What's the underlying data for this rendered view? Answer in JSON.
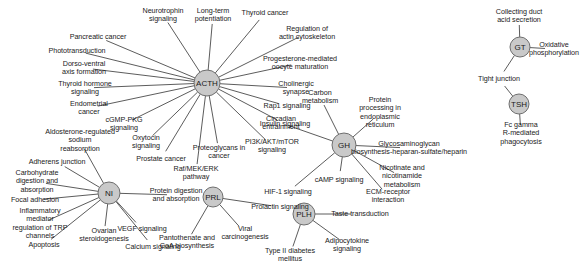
{
  "graph": {
    "title": "Hormone pathway network",
    "node_fill": "#c9c9c9",
    "node_stroke": "#6e6e6e",
    "edge_color": "#4a4a4a",
    "background": "#ffffff",
    "hubs": [
      {
        "id": "acth",
        "label": "ACTH",
        "x": 207,
        "y": 83,
        "r": 13
      },
      {
        "id": "nf",
        "label": "NI",
        "x": 109,
        "y": 193,
        "r": 11
      },
      {
        "id": "prl",
        "label": "PRL",
        "x": 213,
        "y": 197,
        "r": 10
      },
      {
        "id": "gh",
        "label": "GH",
        "x": 344,
        "y": 145,
        "r": 12
      },
      {
        "id": "plh",
        "label": "PLH",
        "x": 304,
        "y": 214,
        "r": 11
      },
      {
        "id": "tsh",
        "label": "TSH",
        "x": 519,
        "y": 104,
        "r": 10
      },
      {
        "id": "gt",
        "label": "GT",
        "x": 520,
        "y": 47,
        "r": 10
      }
    ],
    "leaves": [
      {
        "id": "neurotrophin-signaling",
        "label": "Neurotrophin\nsignaling",
        "x": 163,
        "y": 15,
        "hub": "acth"
      },
      {
        "id": "long-term-potentiation",
        "label": "Long-term\npotentiation",
        "x": 213,
        "y": 15,
        "hub": "acth"
      },
      {
        "id": "thyroid-cancer",
        "label": "Thyroid cancer",
        "x": 265,
        "y": 13,
        "hub": "acth"
      },
      {
        "id": "regulation-actin",
        "label": "Regulation of\nactin cytoskeleton",
        "x": 307,
        "y": 33,
        "hub": "acth"
      },
      {
        "id": "progesterone-oocyte",
        "label": "Progesterone-mediated\noocyte maturation",
        "x": 300,
        "y": 63,
        "hub": "acth"
      },
      {
        "id": "cholinergic-synapse",
        "label": "Cholinergic\nsynapse",
        "x": 296,
        "y": 88,
        "hub": "acth"
      },
      {
        "id": "rap1-signaling",
        "label": "Rap1 signaling",
        "x": 287,
        "y": 106,
        "hub": "acth"
      },
      {
        "id": "insulin-signaling",
        "label": "Insulin signaling",
        "x": 285,
        "y": 124,
        "hub": "acth"
      },
      {
        "id": "pi3k-akt-mtor",
        "label": "PI3K/AKT/mTOR\nsignaling",
        "x": 272,
        "y": 146,
        "hub": "acth"
      },
      {
        "id": "proteoglycans-cancer",
        "label": "Proteoglycans in\ncancer",
        "x": 219,
        "y": 152,
        "hub": "acth"
      },
      {
        "id": "raf-mek-erk",
        "label": "Raf/MEK/ERK\npathway",
        "x": 196,
        "y": 173,
        "hub": "acth"
      },
      {
        "id": "prostate-cancer",
        "label": "Prostate cancer",
        "x": 161,
        "y": 159,
        "hub": "acth"
      },
      {
        "id": "oxytocin-signaling",
        "label": "Oxytocin\nsignaling",
        "x": 146,
        "y": 142,
        "hub": "acth"
      },
      {
        "id": "cgmp-pkg-signaling",
        "label": "cGMP-PKG\nsignaling",
        "x": 124,
        "y": 124,
        "hub": "acth"
      },
      {
        "id": "endometrial-cancer",
        "label": "Endometrial\ncancer",
        "x": 89,
        "y": 108,
        "hub": "acth"
      },
      {
        "id": "thyroid-hormone-signaling",
        "label": "Thyroid hormone\nsignaling",
        "x": 85,
        "y": 88,
        "hub": "acth"
      },
      {
        "id": "dorso-ventral",
        "label": "Dorso-ventral\naxis formation",
        "x": 84,
        "y": 68,
        "hub": "acth"
      },
      {
        "id": "phototransduction",
        "label": "Phototransduction",
        "x": 77,
        "y": 51,
        "hub": "acth"
      },
      {
        "id": "pancreatic-cancer",
        "label": "Pancreatic cancer",
        "x": 98,
        "y": 37,
        "hub": "acth"
      },
      {
        "id": "aldosterone-sodium",
        "label": "Aldosterone-regulated\nsodium\nreabsorption",
        "x": 80,
        "y": 141,
        "hub": "nf"
      },
      {
        "id": "adherens-junction",
        "label": "Adherens junction",
        "x": 57,
        "y": 162,
        "hub": "nf"
      },
      {
        "id": "carbohydrate-digestion",
        "label": "Carbohydrate\ndigestion and\nabsorption",
        "x": 37,
        "y": 182,
        "hub": "nf"
      },
      {
        "id": "focal-adhesion",
        "label": "Focal adhesion",
        "x": 35,
        "y": 200,
        "hub": "nf"
      },
      {
        "id": "inflammatory-trp",
        "label": "Inflammatory\nmediator\nregulation of TRP\nchannels",
        "x": 40,
        "y": 224,
        "hub": "nf"
      },
      {
        "id": "apoptosis",
        "label": "Apoptosis",
        "x": 44,
        "y": 245,
        "hub": "nf"
      },
      {
        "id": "ovarian-steroidogenesis",
        "label": "Ovarian\nsteroidogenesis",
        "x": 104,
        "y": 235,
        "hub": "nf"
      },
      {
        "id": "calcium-signaling",
        "label": "Calcium signaling",
        "x": 153,
        "y": 247,
        "hub": "nf"
      },
      {
        "id": "vegf-signaling",
        "label": "VEGF signaling",
        "x": 142,
        "y": 229,
        "hub": "nf"
      },
      {
        "id": "protein-digestion",
        "label": "Protein digestion\nand absorption",
        "x": 176,
        "y": 195,
        "hub": "nf"
      },
      {
        "id": "pantothenate-coa",
        "label": "Pantothenate and\nCoA biosynthesis",
        "x": 187,
        "y": 242,
        "hub": "prl"
      },
      {
        "id": "viral-carcinogenesis",
        "label": "Viral\ncarcinogenesis",
        "x": 245,
        "y": 233,
        "hub": "prl"
      },
      {
        "id": "prolactin-signaling",
        "label": "Prolactin signaling",
        "x": 280,
        "y": 207,
        "hub": "prl"
      },
      {
        "id": "carbon-metabolism",
        "label": "Carbon\nmetabolism",
        "x": 320,
        "y": 97,
        "hub": "gh"
      },
      {
        "id": "circadian-entrainment",
        "label": "Circadian\nentrainment",
        "x": 281,
        "y": 123,
        "hub": "gh"
      },
      {
        "id": "protein-processing-er",
        "label": "Protein\nprocessing in\nendoplasmic\nreticulum",
        "x": 380,
        "y": 113,
        "hub": "gh"
      },
      {
        "id": "glycosaminoglycan",
        "label": "Glycosaminoglycan\nbiosynthesis-heparan-sulfate/heparin",
        "x": 409,
        "y": 148,
        "hub": "gh"
      },
      {
        "id": "nicotinate-metabolism",
        "label": "Nicotinate and\nnicotinamide\nmetabolism",
        "x": 402,
        "y": 177,
        "hub": "gh"
      },
      {
        "id": "camp-signaling",
        "label": "cAMP signaling",
        "x": 339,
        "y": 180,
        "hub": "gh"
      },
      {
        "id": "ecm-receptor",
        "label": "ECM-receptor\ninteraction",
        "x": 388,
        "y": 196,
        "hub": "gh"
      },
      {
        "id": "hif1-signaling",
        "label": "HIF-1 signaling",
        "x": 288,
        "y": 192,
        "hub": "gh"
      },
      {
        "id": "taste-transduction",
        "label": "Taste transduction",
        "x": 360,
        "y": 214,
        "hub": "plh"
      },
      {
        "id": "adipocytokine-signaling",
        "label": "Adipocytokine\nsignaling",
        "x": 347,
        "y": 245,
        "hub": "plh"
      },
      {
        "id": "type2-diabetes",
        "label": "Type II diabetes\nmellitus",
        "x": 290,
        "y": 255,
        "hub": "plh"
      },
      {
        "id": "collecting-duct",
        "label": "Collecting duct\nacid secretion",
        "x": 519,
        "y": 16,
        "hub": "gt"
      },
      {
        "id": "oxidative-phosphorylation",
        "label": "Oxidative\nphosphorylation",
        "x": 554,
        "y": 49,
        "hub": "gt"
      },
      {
        "id": "tight-junction",
        "label": "Tight junction",
        "x": 499,
        "y": 79,
        "hub": "gt"
      },
      {
        "id": "fc-gamma",
        "label": "Fc gamma\nR-mediated\nphagocytosis",
        "x": 521,
        "y": 134,
        "hub": "tsh"
      }
    ],
    "extra_edges": [
      {
        "from": "tsh",
        "to_leaf": "tight-junction"
      }
    ]
  }
}
